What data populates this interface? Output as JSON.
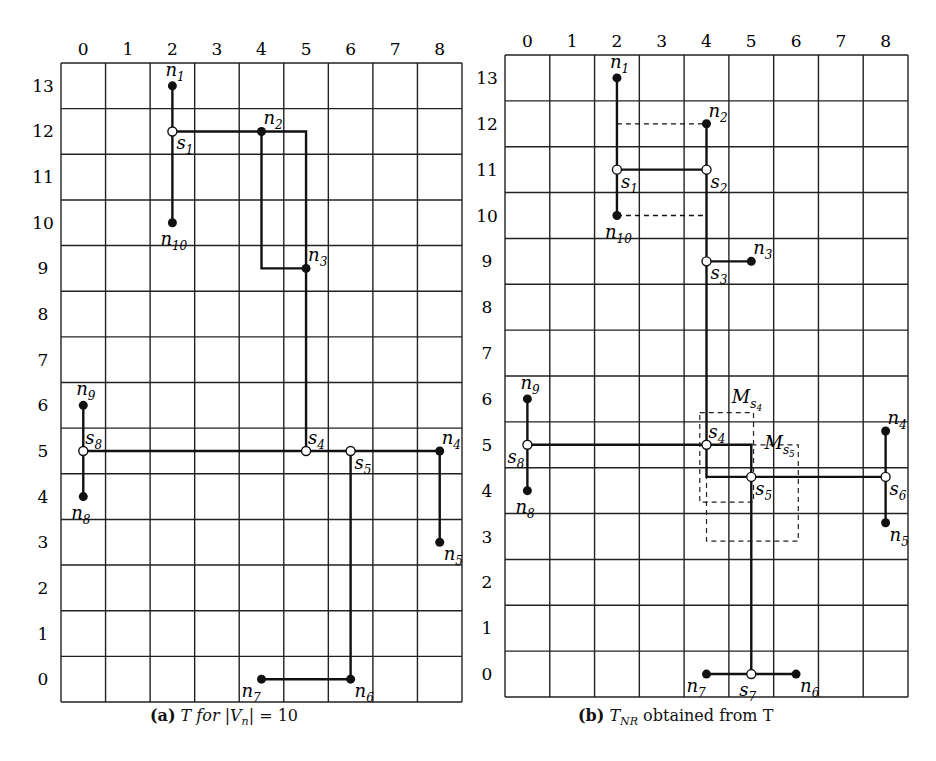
{
  "figure": {
    "panels": [
      {
        "id": "a",
        "caption_prefix": "(a)",
        "caption_rest": "T for |V",
        "caption_sub": "n",
        "caption_tail": "| = 10",
        "caption_full": "(a) T for |Vn| = 10",
        "x_ticks": [
          "0",
          "1",
          "2",
          "3",
          "4",
          "5",
          "6",
          "7",
          "8"
        ],
        "y_ticks": [
          "13",
          "12",
          "11",
          "10",
          "9",
          "8",
          "7",
          "6",
          "5",
          "4",
          "3",
          "2",
          "1",
          "0"
        ],
        "nodes": [
          {
            "name": "n1",
            "type": "terminal",
            "col": 2,
            "row": 13,
            "label": "n",
            "sub": "1",
            "lpos": "top"
          },
          {
            "name": "n2",
            "type": "terminal",
            "col": 4,
            "row": 12,
            "label": "n",
            "sub": "2",
            "lpos": "topright"
          },
          {
            "name": "n3",
            "type": "terminal",
            "col": 5,
            "row": 9,
            "label": "n",
            "sub": "3",
            "lpos": "topright"
          },
          {
            "name": "n4",
            "type": "terminal",
            "col": 8,
            "row": 5,
            "label": "n",
            "sub": "4",
            "lpos": "topright"
          },
          {
            "name": "n5",
            "type": "terminal",
            "col": 8,
            "row": 3,
            "label": "n",
            "sub": "5",
            "lpos": "bottomright"
          },
          {
            "name": "n6",
            "type": "terminal",
            "col": 6,
            "row": 0,
            "label": "n",
            "sub": "6",
            "lpos": "bottomright"
          },
          {
            "name": "n7",
            "type": "terminal",
            "col": 4,
            "row": 0,
            "label": "n",
            "sub": "7",
            "lpos": "bottomleft"
          },
          {
            "name": "n8",
            "type": "terminal",
            "col": 0,
            "row": 4,
            "label": "n",
            "sub": "8",
            "lpos": "bottom"
          },
          {
            "name": "n9",
            "type": "terminal",
            "col": 0,
            "row": 6,
            "label": "n",
            "sub": "9",
            "lpos": "top"
          },
          {
            "name": "n10",
            "type": "terminal",
            "col": 2,
            "row": 10,
            "label": "n",
            "sub": "10",
            "lpos": "bottom"
          },
          {
            "name": "s1",
            "type": "steiner",
            "col": 2,
            "row": 12,
            "label": "s",
            "sub": "1",
            "lpos": "bottomright"
          },
          {
            "name": "s4",
            "type": "steiner",
            "col": 5,
            "row": 5,
            "label": "s",
            "sub": "4",
            "lpos": "topright"
          },
          {
            "name": "s5",
            "type": "steiner",
            "col": 6,
            "row": 5,
            "label": "s",
            "sub": "5",
            "lpos": "bottomright"
          },
          {
            "name": "s8",
            "type": "steiner",
            "col": 0,
            "row": 5,
            "label": "s",
            "sub": "8",
            "lpos": "topright"
          }
        ],
        "edges": [
          {
            "path": [
              [
                2,
                13
              ],
              [
                2,
                10
              ]
            ],
            "style": "solid"
          },
          {
            "path": [
              [
                2,
                12
              ],
              [
                5,
                12
              ],
              [
                5,
                5
              ]
            ],
            "style": "solid"
          },
          {
            "path": [
              [
                4,
                12
              ],
              [
                4,
                9
              ],
              [
                5,
                9
              ]
            ],
            "style": "solid"
          },
          {
            "path": [
              [
                0,
                5
              ],
              [
                8,
                5
              ],
              [
                8,
                3
              ]
            ],
            "style": "solid"
          },
          {
            "path": [
              [
                0,
                6
              ],
              [
                0,
                4
              ]
            ],
            "style": "solid"
          },
          {
            "path": [
              [
                6,
                5
              ],
              [
                6,
                0
              ],
              [
                4,
                0
              ]
            ],
            "style": "solid"
          }
        ]
      },
      {
        "id": "b",
        "caption_prefix": "(b)",
        "caption_rest": "T",
        "caption_sub": "NR",
        "caption_tail": " obtained from T",
        "caption_full": "(b) TNR obtained from T",
        "x_ticks": [
          "0",
          "1",
          "2",
          "3",
          "4",
          "5",
          "6",
          "7",
          "8"
        ],
        "y_ticks": [
          "13",
          "12",
          "11",
          "10",
          "9",
          "8",
          "7",
          "6",
          "5",
          "4",
          "3",
          "2",
          "1",
          "0"
        ],
        "nodes": [
          {
            "name": "n1",
            "type": "terminal",
            "col": 2,
            "row": 13,
            "label": "n",
            "sub": "1",
            "lpos": "top"
          },
          {
            "name": "n2",
            "type": "terminal",
            "col": 4,
            "row": 12,
            "label": "n",
            "sub": "2",
            "lpos": "topright"
          },
          {
            "name": "n3",
            "type": "terminal",
            "col": 5,
            "row": 9,
            "label": "n",
            "sub": "3",
            "lpos": "topright"
          },
          {
            "name": "n4",
            "type": "terminal",
            "col": 8,
            "row": 5.3,
            "label": "n",
            "sub": "4",
            "lpos": "topright"
          },
          {
            "name": "n5",
            "type": "terminal",
            "col": 8,
            "row": 3.3,
            "label": "n",
            "sub": "5",
            "lpos": "bottomright"
          },
          {
            "name": "n6",
            "type": "terminal",
            "col": 6,
            "row": 0,
            "label": "n",
            "sub": "6",
            "lpos": "bottomright"
          },
          {
            "name": "n7",
            "type": "terminal",
            "col": 4,
            "row": 0,
            "label": "n",
            "sub": "7",
            "lpos": "bottomleft"
          },
          {
            "name": "n8",
            "type": "terminal",
            "col": 0,
            "row": 4,
            "label": "n",
            "sub": "8",
            "lpos": "bottom"
          },
          {
            "name": "n9",
            "type": "terminal",
            "col": 0,
            "row": 6,
            "label": "n",
            "sub": "9",
            "lpos": "top"
          },
          {
            "name": "n10",
            "type": "terminal",
            "col": 2,
            "row": 10,
            "label": "n",
            "sub": "10",
            "lpos": "bottom"
          },
          {
            "name": "s1",
            "type": "steiner",
            "col": 2,
            "row": 11,
            "label": "s",
            "sub": "1",
            "lpos": "bottomright"
          },
          {
            "name": "s2",
            "type": "steiner",
            "col": 4,
            "row": 11,
            "label": "s",
            "sub": "2",
            "lpos": "bottomright"
          },
          {
            "name": "s3",
            "type": "steiner",
            "col": 4,
            "row": 9,
            "label": "s",
            "sub": "3",
            "lpos": "bottomright"
          },
          {
            "name": "s4",
            "type": "steiner",
            "col": 4,
            "row": 5,
            "label": "s",
            "sub": "4",
            "lpos": "topright"
          },
          {
            "name": "s5",
            "type": "steiner",
            "col": 5,
            "row": 4.3,
            "label": "s",
            "sub": "5",
            "lpos": "bottomright"
          },
          {
            "name": "s6",
            "type": "steiner",
            "col": 8,
            "row": 4.3,
            "label": "s",
            "sub": "6",
            "lpos": "bottomright"
          },
          {
            "name": "s7",
            "type": "steiner",
            "col": 5,
            "row": 0,
            "label": "s",
            "sub": "7",
            "lpos": "bottom"
          },
          {
            "name": "s8",
            "type": "steiner",
            "col": 0,
            "row": 5,
            "label": "s",
            "sub": "8",
            "lpos": "bottomleft"
          }
        ],
        "edges": [
          {
            "path": [
              [
                2,
                13
              ],
              [
                2,
                10
              ]
            ],
            "style": "solid"
          },
          {
            "path": [
              [
                2,
                11
              ],
              [
                4,
                11
              ]
            ],
            "style": "solid"
          },
          {
            "path": [
              [
                4,
                12
              ],
              [
                4,
                4.3
              ],
              [
                5,
                4.3
              ],
              [
                8,
                4.3
              ]
            ],
            "style": "solid"
          },
          {
            "path": [
              [
                4,
                9
              ],
              [
                5,
                9
              ]
            ],
            "style": "solid"
          },
          {
            "path": [
              [
                0,
                5
              ],
              [
                4,
                5
              ],
              [
                5,
                5
              ],
              [
                5,
                0
              ]
            ],
            "style": "solid"
          },
          {
            "path": [
              [
                0,
                6
              ],
              [
                0,
                4
              ]
            ],
            "style": "solid"
          },
          {
            "path": [
              [
                8,
                5.3
              ],
              [
                8,
                3.3
              ]
            ],
            "style": "solid"
          },
          {
            "path": [
              [
                4,
                0
              ],
              [
                6,
                0
              ]
            ],
            "style": "solid"
          },
          {
            "path": [
              [
                2,
                12
              ],
              [
                4,
                12
              ]
            ],
            "style": "dashed"
          },
          {
            "path": [
              [
                2,
                10
              ],
              [
                4,
                10
              ]
            ],
            "style": "dashed"
          }
        ],
        "boxes": [
          {
            "name": "M_s4",
            "label": "M",
            "sub": "s",
            "subsub": "4",
            "x0": 3.85,
            "y0": 5.7,
            "x1": 5.05,
            "y1": 3.75
          },
          {
            "name": "M_s5",
            "label": "M",
            "sub": "s",
            "subsub": "5",
            "x0": 4.0,
            "y0": 5.0,
            "x1": 6.05,
            "y1": 2.9
          }
        ]
      }
    ]
  }
}
